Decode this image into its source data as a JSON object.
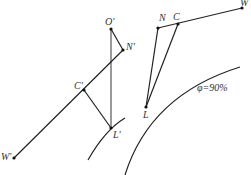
{
  "diagram": {
    "points": {
      "O_prime": {
        "label": "O′",
        "x": 111,
        "y": 29
      },
      "N_prime": {
        "label": "N′",
        "x": 123,
        "y": 50
      },
      "C_prime": {
        "label": "C′",
        "x": 84,
        "y": 90
      },
      "L_prime": {
        "label": "L′",
        "x": 111,
        "y": 128
      },
      "W_prime": {
        "label": "W′",
        "x": 14,
        "y": 158
      },
      "N": {
        "label": "N",
        "x": 158,
        "y": 28
      },
      "C": {
        "label": "C",
        "x": 178,
        "y": 24
      },
      "W": {
        "label": "W",
        "x": 242,
        "y": 8
      },
      "L": {
        "label": "L",
        "x": 146,
        "y": 107
      }
    },
    "curve_label": "φ=90%",
    "colors": {
      "line": "#222222",
      "vertical": "#555555",
      "text": "#333333",
      "background": "#ffffff"
    }
  }
}
